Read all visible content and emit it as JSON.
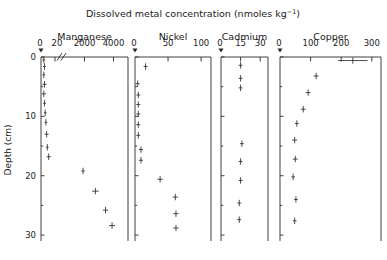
{
  "figure": {
    "title": "Dissolved metal concentration (nmoles kg",
    "title_sup": "−1",
    "title_tail": ")",
    "ylabel": "Depth (cm)",
    "ylabel_ticks": [
      "0",
      "10",
      "20",
      "30"
    ]
  },
  "chart_data": {
    "type": "scatter",
    "ylabel": "Depth (cm)",
    "ylim": [
      0,
      31
    ],
    "y_ticks": [
      0,
      10,
      20,
      30
    ],
    "y_minor_ticks": [
      5,
      15,
      25
    ],
    "y_inverted": true,
    "grid": false,
    "orientation": "depth-profile",
    "marker": "cross-with-error-bars",
    "panels": [
      {
        "name": "Manganese",
        "label": "Manganese",
        "broken_axis": true,
        "axis_break_symbol": "//",
        "lower_ticks": [
          "0",
          "20"
        ],
        "upper_ticks": [
          "2000",
          "4000"
        ],
        "zero_label": "0",
        "lower_range": [
          0,
          20
        ],
        "upper_range": [
          1000,
          5000
        ],
        "xlabel": "",
        "points": [
          {
            "depth": 0.5,
            "value": 4,
            "xerr": 2,
            "scale": "lower"
          },
          {
            "depth": 1.6,
            "value": 5,
            "xerr": 2,
            "scale": "lower"
          },
          {
            "depth": 3.0,
            "value": 4,
            "xerr": 2,
            "scale": "lower"
          },
          {
            "depth": 4.6,
            "value": 5,
            "xerr": 3,
            "scale": "lower"
          },
          {
            "depth": 6.2,
            "value": 4,
            "xerr": 3,
            "scale": "lower"
          },
          {
            "depth": 7.8,
            "value": 5,
            "xerr": 2,
            "scale": "lower"
          },
          {
            "depth": 9.4,
            "value": 6,
            "xerr": 2,
            "scale": "lower"
          },
          {
            "depth": 11.0,
            "value": 7,
            "xerr": 2,
            "scale": "lower"
          },
          {
            "depth": 13.0,
            "value": 8,
            "xerr": 3,
            "scale": "lower"
          },
          {
            "depth": 15.2,
            "value": 9,
            "xerr": 2,
            "scale": "lower"
          },
          {
            "depth": 16.8,
            "value": 11,
            "xerr": 3,
            "scale": "lower"
          },
          {
            "depth": 19.2,
            "value": 1900,
            "xerr": 120,
            "scale": "upper"
          },
          {
            "depth": 22.6,
            "value": 2750,
            "xerr": 230,
            "scale": "upper"
          },
          {
            "depth": 25.8,
            "value": 3450,
            "xerr": 180,
            "scale": "upper"
          },
          {
            "depth": 28.4,
            "value": 3900,
            "xerr": 200,
            "scale": "upper"
          }
        ]
      },
      {
        "name": "Nickel",
        "label": "Nickel",
        "broken_axis": false,
        "ticks": [
          "0",
          "50",
          "100"
        ],
        "xlim": [
          0,
          115
        ],
        "zero_label": "0",
        "points": [
          {
            "depth": 1.6,
            "value": 16,
            "xerr": 3
          },
          {
            "depth": 4.5,
            "value": 4,
            "xerr": 3
          },
          {
            "depth": 6.4,
            "value": 5,
            "xerr": 3
          },
          {
            "depth": 8.0,
            "value": 5,
            "xerr": 3
          },
          {
            "depth": 9.6,
            "value": 5,
            "xerr": 3
          },
          {
            "depth": 11.4,
            "value": 5,
            "xerr": 3
          },
          {
            "depth": 13.2,
            "value": 5,
            "xerr": 3
          },
          {
            "depth": 15.6,
            "value": 9,
            "xerr": 3
          },
          {
            "depth": 17.4,
            "value": 9,
            "xerr": 3
          },
          {
            "depth": 20.6,
            "value": 38,
            "xerr": 4
          },
          {
            "depth": 23.6,
            "value": 61,
            "xerr": 4
          },
          {
            "depth": 26.4,
            "value": 62,
            "xerr": 4
          },
          {
            "depth": 28.8,
            "value": 62,
            "xerr": 4
          }
        ]
      },
      {
        "name": "Cadmium",
        "label": "Cadmium",
        "broken_axis": false,
        "ticks": [
          "0",
          "15",
          "30"
        ],
        "xlim": [
          0,
          36
        ],
        "zero_label": "0",
        "points": [
          {
            "depth": 1.4,
            "value": 15,
            "xerr": 1.5
          },
          {
            "depth": 3.6,
            "value": 15,
            "xerr": 1.5
          },
          {
            "depth": 5.2,
            "value": 15,
            "xerr": 1.5
          },
          {
            "depth": 14.6,
            "value": 16,
            "xerr": 1.5
          },
          {
            "depth": 17.6,
            "value": 15,
            "xerr": 1.5
          },
          {
            "depth": 20.8,
            "value": 15,
            "xerr": 1.5
          },
          {
            "depth": 24.6,
            "value": 14,
            "xerr": 1.5
          },
          {
            "depth": 27.4,
            "value": 14,
            "xerr": 1.5
          }
        ]
      },
      {
        "name": "Copper",
        "label": "Copper",
        "broken_axis": false,
        "ticks": [
          "0",
          "100",
          "200",
          "300"
        ],
        "xlim": [
          0,
          330
        ],
        "zero_label": "0",
        "points": [
          {
            "depth": 0.6,
            "value": 238,
            "xerr": 48
          },
          {
            "depth": 3.2,
            "value": 118,
            "xerr": 8
          },
          {
            "depth": 6.0,
            "value": 92,
            "xerr": 8
          },
          {
            "depth": 8.8,
            "value": 76,
            "xerr": 8
          },
          {
            "depth": 11.2,
            "value": 55,
            "xerr": 6
          },
          {
            "depth": 14.0,
            "value": 48,
            "xerr": 8
          },
          {
            "depth": 17.2,
            "value": 50,
            "xerr": 8
          },
          {
            "depth": 20.2,
            "value": 43,
            "xerr": 6
          },
          {
            "depth": 24.0,
            "value": 52,
            "xerr": 6
          },
          {
            "depth": 27.6,
            "value": 48,
            "xerr": 6
          }
        ]
      }
    ]
  }
}
